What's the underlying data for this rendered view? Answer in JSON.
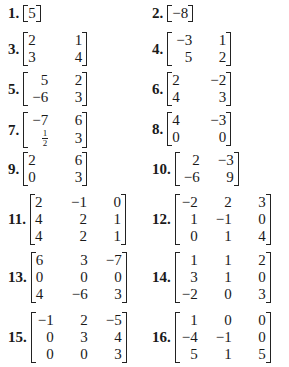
{
  "problems": [
    {
      "label": "1.",
      "rows": [
        [
          "5"
        ]
      ]
    },
    {
      "label": "2.",
      "rows": [
        [
          "−8"
        ]
      ]
    },
    {
      "label": "3.",
      "rows": [
        [
          "2",
          "1"
        ],
        [
          "3",
          "4"
        ]
      ]
    },
    {
      "label": "4.",
      "rows": [
        [
          "−3",
          "1"
        ],
        [
          "5",
          "2"
        ]
      ]
    },
    {
      "label": "5.",
      "rows": [
        [
          "5",
          "2"
        ],
        [
          "−6",
          "3"
        ]
      ]
    },
    {
      "label": "6.",
      "rows": [
        [
          "2",
          "−2"
        ],
        [
          "4",
          "3"
        ]
      ]
    },
    {
      "label": "7.",
      "rows": [
        [
          "−7",
          "6"
        ],
        [
          "1/2",
          "3"
        ]
      ]
    },
    {
      "label": "8.",
      "rows": [
        [
          "4",
          "−3"
        ],
        [
          "0",
          "0"
        ]
      ]
    },
    {
      "label": "9.",
      "rows": [
        [
          "2",
          "6"
        ],
        [
          "0",
          "3"
        ]
      ]
    },
    {
      "label": "10.",
      "rows": [
        [
          "2",
          "−3"
        ],
        [
          "−6",
          "9"
        ]
      ]
    },
    {
      "label": "11.",
      "rows": [
        [
          "2",
          "−1",
          "0"
        ],
        [
          "4",
          "2",
          "1"
        ],
        [
          "4",
          "2",
          "1"
        ]
      ]
    },
    {
      "label": "12.",
      "rows": [
        [
          "−2",
          "2",
          "3"
        ],
        [
          "1",
          "−1",
          "0"
        ],
        [
          "0",
          "1",
          "4"
        ]
      ]
    },
    {
      "label": "13.",
      "rows": [
        [
          "6",
          "3",
          "−7"
        ],
        [
          "0",
          "0",
          "0"
        ],
        [
          "4",
          "−6",
          "3"
        ]
      ]
    },
    {
      "label": "14.",
      "rows": [
        [
          "1",
          "1",
          "2"
        ],
        [
          "3",
          "1",
          "0"
        ],
        [
          "−2",
          "0",
          "3"
        ]
      ]
    },
    {
      "label": "15.",
      "rows": [
        [
          "−1",
          "2",
          "−5"
        ],
        [
          "0",
          "3",
          "4"
        ],
        [
          "0",
          "0",
          "3"
        ]
      ]
    },
    {
      "label": "16.",
      "rows": [
        [
          "1",
          "0",
          "0"
        ],
        [
          "−4",
          "−1",
          "0"
        ],
        [
          "5",
          "1",
          "5"
        ]
      ]
    }
  ],
  "layout": {
    "positions": [
      [
        8,
        5
      ],
      [
        152,
        5
      ],
      [
        8,
        32
      ],
      [
        152,
        32
      ],
      [
        8,
        72
      ],
      [
        152,
        72
      ],
      [
        8,
        112
      ],
      [
        152,
        112
      ],
      [
        8,
        152
      ],
      [
        152,
        152
      ],
      [
        8,
        194
      ],
      [
        152,
        194
      ],
      [
        8,
        252
      ],
      [
        152,
        252
      ],
      [
        8,
        312
      ],
      [
        152,
        312
      ]
    ]
  }
}
